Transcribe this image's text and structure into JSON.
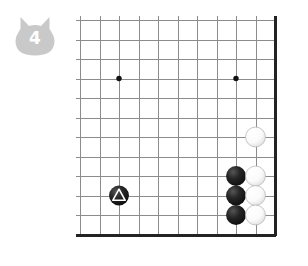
{
  "badge": {
    "icon": "cat-head-badge",
    "move_number": "4",
    "fill_color": "#c9c9c9",
    "text_color": "#ffffff"
  },
  "board": {
    "name": "go-board-diagram",
    "columns": 11,
    "rows": 12,
    "cell_size": 19.5,
    "origin_x": 4,
    "origin_y": 4,
    "line_color": "#8c8c8c",
    "edge_color": "#232323",
    "edges": [
      "right",
      "bottom"
    ],
    "star_points": [
      {
        "col": 2,
        "row": 3
      },
      {
        "col": 8,
        "row": 3
      }
    ],
    "stones": [
      {
        "name": "white-stone",
        "color": "white",
        "col": 9,
        "row": 6,
        "marked": false
      },
      {
        "name": "black-stone",
        "color": "black",
        "col": 8,
        "row": 8,
        "marked": false
      },
      {
        "name": "white-stone",
        "color": "white",
        "col": 9,
        "row": 8,
        "marked": false
      },
      {
        "name": "black-stone",
        "color": "black",
        "col": 8,
        "row": 9,
        "marked": false
      },
      {
        "name": "white-stone",
        "color": "white",
        "col": 9,
        "row": 9,
        "marked": false
      },
      {
        "name": "black-stone",
        "color": "black",
        "col": 8,
        "row": 10,
        "marked": false
      },
      {
        "name": "white-stone",
        "color": "white",
        "col": 9,
        "row": 10,
        "marked": false
      },
      {
        "name": "black-stone-marked",
        "color": "black",
        "col": 2,
        "row": 9,
        "marked": true,
        "mark": "triangle"
      }
    ]
  },
  "colors": {
    "black_stone": "#1b1b1b",
    "white_stone": "#fdfdfd",
    "background": "#ffffff"
  }
}
